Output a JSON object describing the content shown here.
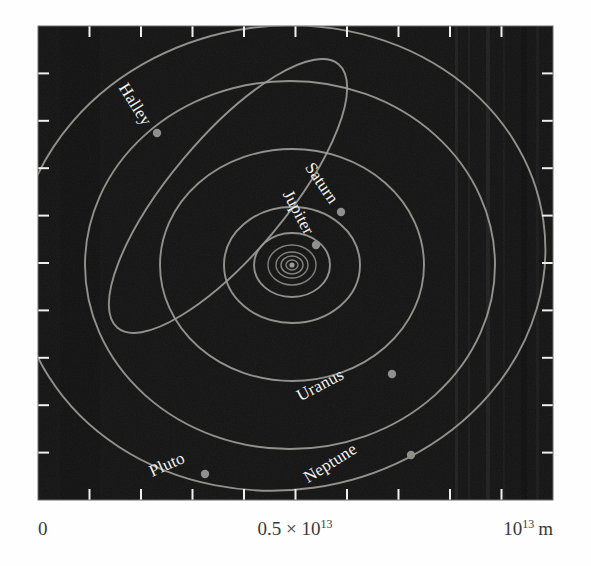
{
  "figure": {
    "background_color": "#141414",
    "plot_frame": {
      "x": 38,
      "y": 26,
      "width": 515,
      "height": 474
    },
    "orbit_color": "#9b9b97",
    "marker_color": "#8f8f8c",
    "label_color": "#f2f2f0",
    "axis_text_color": "#3a3a3a",
    "tick_color": "#f0f0ee"
  },
  "axis": {
    "labels": [
      {
        "name": "origin",
        "text": "0",
        "x_frac": 0.0
      },
      {
        "name": "midpoint",
        "mantissa": "0.5 × 10",
        "exponent": "13",
        "x_frac": 0.5
      },
      {
        "name": "maximum",
        "mantissa": "10",
        "exponent": "13",
        "unit": "m",
        "x_frac": 1.0
      }
    ],
    "tick_count_interior": 9,
    "tick_fractions": [
      0.1,
      0.2,
      0.3,
      0.4,
      0.5,
      0.6,
      0.7,
      0.8,
      0.9
    ],
    "unit_label": "m",
    "scale_max": "1e13",
    "scale_unit": "meters"
  },
  "chart_data": {
    "type": "scatter",
    "xlabel": "",
    "ylabel": "",
    "xlim": [
      0,
      10000000000000.0
    ],
    "ylim": [
      0,
      10000000000000.0
    ],
    "grid": false,
    "legend": "none",
    "projection": "orbital-plane-view",
    "sun": {
      "cx": 292,
      "cy": 265,
      "label": ""
    },
    "orbits": [
      {
        "name": "Mercury",
        "cx": 292,
        "cy": 265,
        "rx": 6,
        "ry": 5,
        "rotate": 0,
        "labeled": false
      },
      {
        "name": "Venus",
        "cx": 292,
        "cy": 265,
        "rx": 11,
        "ry": 9,
        "rotate": 0,
        "labeled": false
      },
      {
        "name": "Earth",
        "cx": 292,
        "cy": 265,
        "rx": 16,
        "ry": 13,
        "rotate": 0,
        "labeled": false
      },
      {
        "name": "Mars",
        "cx": 292,
        "cy": 265,
        "rx": 24,
        "ry": 20,
        "rotate": 0,
        "labeled": false
      },
      {
        "name": "Jupiter",
        "cx": 292,
        "cy": 265,
        "rx": 38,
        "ry": 32,
        "rotate": 0,
        "labeled": true
      },
      {
        "name": "Saturn",
        "cx": 292,
        "cy": 265,
        "rx": 68,
        "ry": 58,
        "rotate": 0,
        "labeled": true
      },
      {
        "name": "Uranus",
        "cx": 292,
        "cy": 265,
        "rx": 132,
        "ry": 116,
        "rotate": 0,
        "labeled": true
      },
      {
        "name": "Neptune",
        "cx": 290,
        "cy": 265,
        "rx": 205,
        "ry": 184,
        "rotate": 0,
        "labeled": true
      },
      {
        "name": "Pluto",
        "cx": 281,
        "cy": 258,
        "rx": 265,
        "ry": 232,
        "rotate": -8,
        "labeled": true
      },
      {
        "name": "Halley",
        "cx": 228,
        "cy": 196,
        "rx": 172,
        "ry": 58,
        "rotate": -50,
        "labeled": true
      }
    ],
    "bodies": [
      {
        "name": "Halley",
        "label": "Halley",
        "x": 157,
        "y": 133,
        "label_x": 143,
        "label_y": 127,
        "label_rotate": 58
      },
      {
        "name": "Saturn",
        "label": "Saturn",
        "x": 341,
        "y": 212,
        "label_x": 330,
        "label_y": 205,
        "label_rotate": 56
      },
      {
        "name": "Jupiter",
        "label": "Jupiter",
        "x": 316,
        "y": 245,
        "label_x": 305,
        "label_y": 236,
        "label_rotate": 62
      },
      {
        "name": "Uranus",
        "label": "Uranus",
        "x": 392,
        "y": 374,
        "label_x": 345,
        "label_y": 378,
        "label_rotate": -28
      },
      {
        "name": "Neptune",
        "label": "Neptune",
        "x": 411,
        "y": 455,
        "label_x": 358,
        "label_y": 452,
        "label_rotate": -32
      },
      {
        "name": "Pluto",
        "label": "Pluto",
        "x": 205,
        "y": 474,
        "label_x": 186,
        "label_y": 462,
        "label_rotate": -24
      }
    ]
  }
}
